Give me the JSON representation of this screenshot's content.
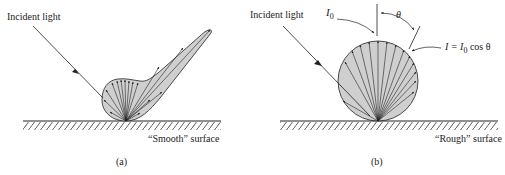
{
  "panels": [
    {
      "id": "a",
      "caption": "(a)",
      "incident_label": "Incident light",
      "surface_label": "“Smooth” surface",
      "reflection_type": "specular lobe"
    },
    {
      "id": "b",
      "caption": "(b)",
      "incident_label": "Incident light",
      "surface_label": "“Rough” surface",
      "reflection_type": "diffuse (Lambertian)",
      "i0_label": "I",
      "i0_sub": "0",
      "theta_label": "θ",
      "formula": {
        "lhs": "I = I",
        "sub": "0",
        "rhs": " cos θ"
      }
    }
  ],
  "colors": {
    "fill": "#cfcfcf",
    "line": "#222222",
    "background": "#ffffff"
  }
}
